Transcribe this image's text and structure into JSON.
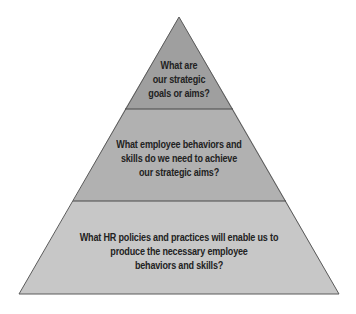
{
  "diagram": {
    "type": "pyramid",
    "tiers": [
      {
        "name": "top",
        "fill": "#9f9f9f",
        "lines": [
          "What are",
          "our strategic",
          "goals or aims?"
        ]
      },
      {
        "name": "middle",
        "fill": "#b1b1b1",
        "lines": [
          "What employee behaviors and",
          "skills do we need to achieve",
          "our strategic aims?"
        ]
      },
      {
        "name": "bottom",
        "fill": "#c7c7c7",
        "lines": [
          "What HR policies and practices will enable us to",
          "produce the necessary employee",
          "behaviors and skills?"
        ]
      }
    ],
    "outline_color": "#555555",
    "text_color": "#222222"
  }
}
